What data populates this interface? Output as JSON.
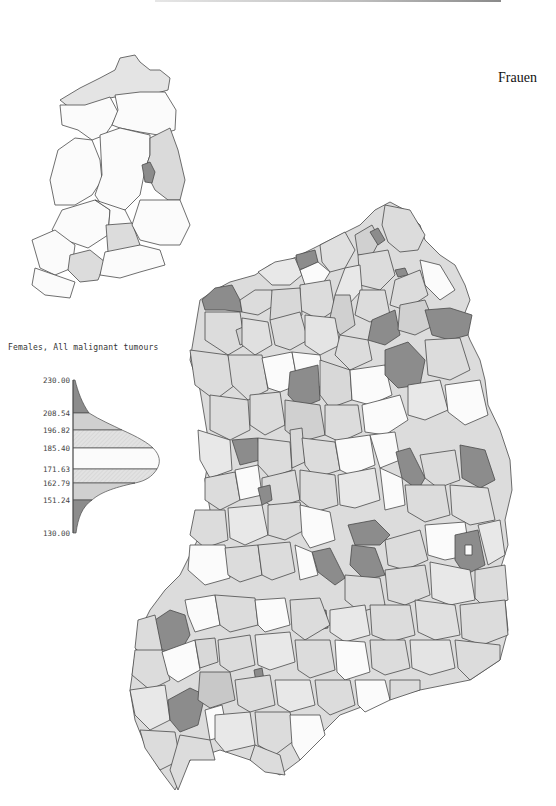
{
  "page": {
    "title": "Frauen",
    "legend_title": "Females, All malignant tumours"
  },
  "colors": {
    "class_1": "#8c8c8c",
    "class_2": "#c8c8c8",
    "class_3": "#dcdcdc",
    "class_4": "#fbfbfb",
    "class_5": "#e8e8e8",
    "class_6": "#d0d0d0",
    "class_7": "#8c8c8c",
    "outline": "#4a4a4a"
  },
  "legend": {
    "ticks": [
      {
        "label": "230.00",
        "value": 230.0
      },
      {
        "label": "208.54",
        "value": 208.54
      },
      {
        "label": "196.82",
        "value": 196.82
      },
      {
        "label": "185.40",
        "value": 185.4
      },
      {
        "label": "171.63",
        "value": 171.63
      },
      {
        "label": "162.79",
        "value": 162.79
      },
      {
        "label": "151.24",
        "value": 151.24
      },
      {
        "label": "130.00",
        "value": 130.0
      }
    ]
  },
  "maps": {
    "inset": {
      "description": "Overview map by Bezirk (districts)"
    },
    "main": {
      "description": "Choropleth map by Kreis (counties)"
    }
  }
}
